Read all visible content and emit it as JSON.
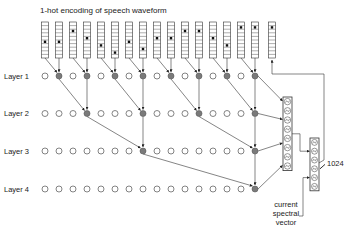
{
  "title": "1-hot encoding of speech waveform",
  "layers": [
    {
      "label": "Layer 1",
      "active_columns": [
        1,
        3,
        5,
        7,
        9,
        11,
        13,
        15
      ]
    },
    {
      "label": "Layer 2",
      "active_columns": [
        3,
        7,
        11,
        15
      ]
    },
    {
      "label": "Layer 3",
      "active_columns": [
        7,
        15
      ]
    },
    {
      "label": "Layer 4",
      "active_columns": [
        15
      ]
    }
  ],
  "num_columns": 16,
  "one_hot_positions": [
    5,
    5,
    2,
    4,
    6,
    8,
    5,
    7,
    4,
    4,
    2,
    2,
    4,
    6,
    1,
    1
  ],
  "output_one_hot_position": 1,
  "output_size_label": "1024",
  "conditioning_label": [
    "current",
    "spectral",
    "vector"
  ],
  "colors": {
    "line": "#333333",
    "active_node": "#7a7a7a",
    "inactive_node": "#ffffff"
  }
}
